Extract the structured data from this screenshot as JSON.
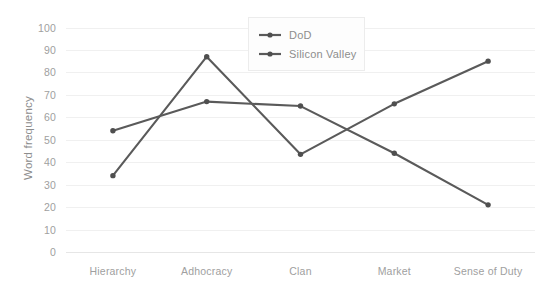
{
  "chart_data": {
    "type": "line",
    "title": "",
    "subtitle": "",
    "xlabel": "",
    "ylabel": "Word frequency",
    "categories": [
      "Hierarchy",
      "Adhocracy",
      "Clan",
      "Market",
      "Sense of Duty"
    ],
    "series": [
      {
        "name": "DoD",
        "values": [
          54,
          67,
          65,
          44,
          21
        ],
        "color": "#5a5a5a"
      },
      {
        "name": "Silicon Valley",
        "values": [
          34,
          87,
          43.5,
          66,
          85
        ],
        "color": "#5a5a5a"
      }
    ],
    "ylim": [
      0,
      100
    ],
    "y_ticks": [
      100,
      90,
      80,
      70,
      60,
      50,
      40,
      30,
      20,
      10,
      0
    ],
    "grid": true,
    "grid_axis": "y",
    "legend": true,
    "legend_position": "top-center",
    "legend_entries": [
      "DoD",
      "Silicon Valley"
    ],
    "marker": "circle",
    "colors": {
      "line": "#5a5a5a",
      "marker": "#4f4f4f",
      "gridline": "#f0f0f0",
      "baseline": "#e6e6e6",
      "tick_text": "#a0a0a0",
      "axis_title": "#8d8d8d",
      "legend_border": "#ececec",
      "legend_background": "#fdfdfd",
      "plot_background": "#ffffff"
    }
  },
  "axis": {
    "y_title": "Word frequency",
    "y_labels": [
      "100",
      "90",
      "80",
      "70",
      "60",
      "50",
      "40",
      "30",
      "20",
      "10",
      "0"
    ],
    "x_labels": [
      "Hierarchy",
      "Adhocracy",
      "Clan",
      "Market",
      "Sense of Duty"
    ]
  },
  "legend": {
    "items": [
      {
        "label": "DoD"
      },
      {
        "label": "Silicon Valley"
      }
    ]
  }
}
